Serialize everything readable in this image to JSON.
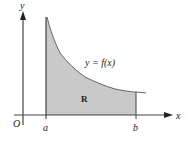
{
  "figure": {
    "type": "area-under-curve",
    "labels": {
      "y_axis": "y",
      "x_axis": "x",
      "origin": "O",
      "a": "a",
      "b": "b",
      "curve": "y = f(x)",
      "region": "R"
    },
    "colors": {
      "region_fill": "#c9c9c9",
      "axis": "#444444",
      "curve": "#555555",
      "background": "#ffffff"
    },
    "geometry": {
      "origin_px": [
        23,
        115
      ],
      "a_px": 46,
      "b_px": 136,
      "curve_points_px": [
        [
          47,
          17
        ],
        [
          50,
          30
        ],
        [
          55,
          43
        ],
        [
          60,
          53
        ],
        [
          67,
          62
        ],
        [
          75,
          70
        ],
        [
          85,
          77
        ],
        [
          95,
          82
        ],
        [
          105,
          86
        ],
        [
          115,
          89
        ],
        [
          125,
          91
        ],
        [
          136,
          92
        ],
        [
          146,
          93
        ]
      ]
    }
  }
}
